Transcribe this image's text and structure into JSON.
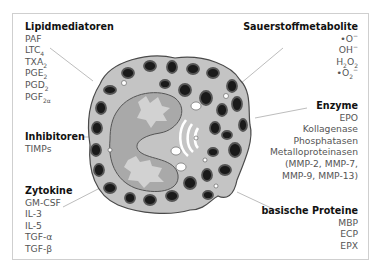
{
  "figure": {
    "groups": {
      "lipid": {
        "title": "Lipidmediatoren",
        "items": [
          "PAF",
          "LTC4",
          "TXA2",
          "PGE2",
          "PGD2",
          "PGF2α"
        ]
      },
      "inhib": {
        "title": "Inhibitoren",
        "items": [
          "TIMPs"
        ]
      },
      "zyto": {
        "title": "Zytokine",
        "items": [
          "GM-CSF",
          "IL-3",
          "IL-5",
          "TGF-α",
          "TGF-β"
        ]
      },
      "oxy": {
        "title": "Sauerstoffmetabolite",
        "items": [
          "•O⁻",
          "OH⁻",
          "H2O2",
          "•O2⁻"
        ]
      },
      "enz": {
        "title": "Enzyme",
        "items": [
          "EPO",
          "Kollagenase",
          "Phosphatasen",
          "Metalloproteinasen",
          "(MMP-2, MMP-7,",
          "MMP-9, MMP-13)"
        ]
      },
      "basic": {
        "title": "basische Proteine",
        "items": [
          "MBP",
          "ECP",
          "EPX"
        ]
      }
    },
    "colors": {
      "cytoplasm": "#c4c4c4",
      "nucleus": "#a9a9a9",
      "nucleus_light": "#d2d2d2",
      "granule_dark": "#1a1a1a",
      "granule_rim": "#555555",
      "leader_line": "#bdbdbd",
      "frame": "#cfcfcf"
    }
  }
}
